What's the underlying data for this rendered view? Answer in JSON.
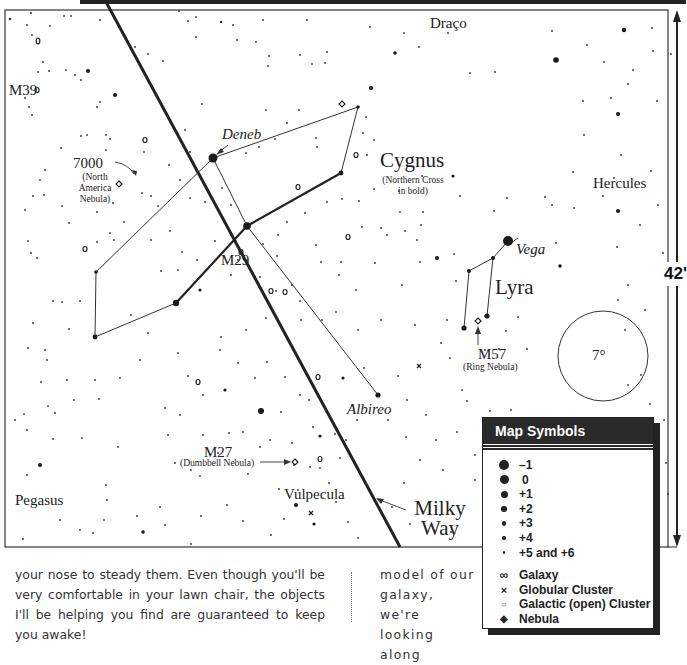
{
  "map": {
    "constellations": {
      "draco": "Draço",
      "cygnus": "Cygnus",
      "cygnus_note": "(Northern Cross in bold)",
      "hercules": "Hercules",
      "lyra": "Lyra",
      "pegasus": "Pegasus",
      "vulpecula": "Vulpecula"
    },
    "stars": {
      "deneb": "Deneb",
      "vega": "Vega",
      "albireo": "Albireo"
    },
    "objects": {
      "m39": "M39",
      "ngc7000": "7000",
      "ngc7000_note": "(North America Nebula)",
      "m29": "M29",
      "m57": "M57",
      "m57_note": "(Ring Nebula)",
      "m27": "M27",
      "m27_note": "(Dumbbell Nebula)"
    },
    "milky_way": "Milky Way",
    "field_circle": "7°",
    "scale_label": "42'"
  },
  "legend": {
    "title": "Map Symbols",
    "magnitudes": [
      {
        "size": 10,
        "label": "–1"
      },
      {
        "size": 9,
        "label": " 0"
      },
      {
        "size": 7,
        "label": "+1"
      },
      {
        "size": 5.5,
        "label": "+2"
      },
      {
        "size": 4.5,
        "label": "+3"
      },
      {
        "size": 3.5,
        "label": "+4"
      },
      {
        "size": 2.5,
        "label": "+5 and +6"
      }
    ],
    "object_types": [
      {
        "icon": "galaxy-icon",
        "glyph": "∞",
        "label": "Galaxy"
      },
      {
        "icon": "globular-cluster-icon",
        "glyph": "×",
        "label": "Globular Cluster"
      },
      {
        "icon": "open-cluster-icon",
        "glyph": "○",
        "label": "Galactic (open) Cluster"
      },
      {
        "icon": "nebula-icon",
        "glyph": "◈",
        "label": "Nebula"
      }
    ]
  },
  "text": {
    "column1": "your nose to steady them. Even though you'll be very comfortable in your lawn chair, the objects I'll be helping you find are guaranteed to keep you awake!",
    "column2": "model of our galaxy, we're looking along"
  }
}
